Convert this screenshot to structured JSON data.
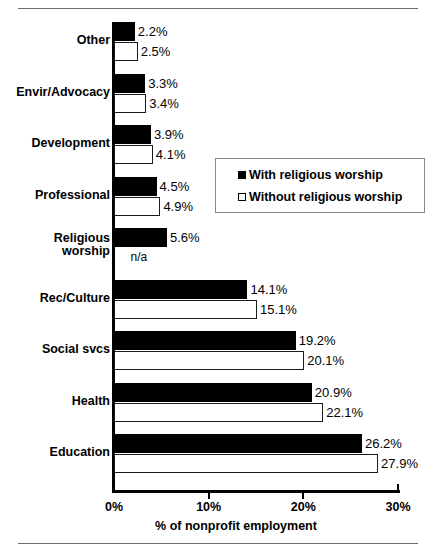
{
  "chart_data": {
    "type": "bar",
    "orientation": "horizontal",
    "title": "",
    "xlabel": "% of nonprofit employment",
    "ylabel": "",
    "xlim": [
      0,
      30
    ],
    "xticks": [
      "0%",
      "10%",
      "20%",
      "30%"
    ],
    "xtick_values": [
      0,
      10,
      20,
      30
    ],
    "grid": false,
    "legend_position": "upper right inset",
    "categories": [
      "Other",
      "Envir/Advocacy",
      "Development",
      "Professional",
      "Religious worship",
      "Rec/Culture",
      "Social svcs",
      "Health",
      "Education"
    ],
    "category_lines": [
      [
        "Other"
      ],
      [
        "Envir/Advocacy"
      ],
      [
        "Development"
      ],
      [
        "Professional"
      ],
      [
        "Religious",
        "worship"
      ],
      [
        "Rec/Culture"
      ],
      [
        "Social svcs"
      ],
      [
        "Health"
      ],
      [
        "Education"
      ]
    ],
    "series": [
      {
        "name": "With religious worship",
        "style": "filled",
        "values": [
          2.2,
          3.3,
          3.9,
          4.5,
          5.6,
          14.1,
          19.2,
          20.9,
          26.2
        ],
        "labels": [
          "2.2%",
          "3.3%",
          "3.9%",
          "4.5%",
          "5.6%",
          "14.1%",
          "19.2%",
          "20.9%",
          "26.2%"
        ]
      },
      {
        "name": "Without religious worship",
        "style": "hollow",
        "values": [
          2.5,
          3.4,
          4.1,
          4.9,
          null,
          15.1,
          20.1,
          22.1,
          27.9
        ],
        "labels": [
          "2.5%",
          "3.4%",
          "4.1%",
          "4.9%",
          "n/a",
          "15.1%",
          "20.1%",
          "22.1%",
          "27.9%"
        ]
      }
    ],
    "colors": {
      "series_filled": "#000000",
      "series_hollow": "#ffffff",
      "axis": "#000000",
      "text": "#000000",
      "rule": "#6f6f6f"
    }
  },
  "legend": {
    "items": [
      {
        "label": "With religious worship",
        "style": "filled"
      },
      {
        "label": "Without religious worship",
        "style": "hollow"
      }
    ]
  }
}
